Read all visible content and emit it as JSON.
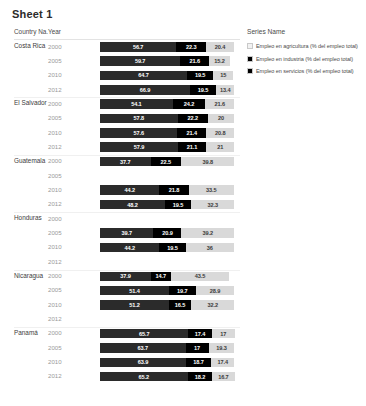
{
  "title": "Sheet 1",
  "table": {
    "headers": {
      "country": "Country Na.",
      "year": "Year"
    }
  },
  "legend": {
    "title": "Series Name",
    "items": [
      {
        "label": "Empleo en agricultura (% del empleo total)",
        "color": "#2b2b2b",
        "key": "agriculture"
      },
      {
        "label": "Empleo en industria (% del empleo total)",
        "color": "#000000",
        "key": "industry"
      },
      {
        "label": "Empleo en servicios (% del empleo total)",
        "color": "#000000",
        "key": "services"
      }
    ]
  },
  "chart_data": {
    "type": "bar",
    "title": "Sheet 1",
    "xlabel": "",
    "ylabel": "",
    "stacked": true,
    "orientation": "horizontal",
    "xlim": [
      0,
      100
    ],
    "grid": false,
    "legend_position": "right",
    "series_names": [
      "Empleo en agricultura (% del empleo total)",
      "Empleo en industria (% del empleo total)",
      "Empleo en servicios (% del empleo total)"
    ],
    "series_colors": [
      "#2b2b2b",
      "#000000",
      "#d9d9d9"
    ],
    "groups": [
      {
        "country": "Costa Rica",
        "rows": [
          {
            "year": "2000",
            "values": [
              56.7,
              22.3,
              20.4
            ],
            "labels": [
              "56.7",
              "22.3",
              "20.4"
            ]
          },
          {
            "year": "2005",
            "values": [
              59.7,
              21.6,
              15.2
            ],
            "labels": [
              "59.7",
              "21.6",
              "15.2"
            ]
          },
          {
            "year": "2010",
            "values": [
              64.7,
              19.5,
              15
            ],
            "labels": [
              "64.7",
              "19.5",
              "15"
            ]
          },
          {
            "year": "2012",
            "values": [
              66.9,
              19.5,
              13.4
            ],
            "labels": [
              "66.9",
              "19.5",
              "13.4"
            ]
          }
        ]
      },
      {
        "country": "El Salvador",
        "rows": [
          {
            "year": "2000",
            "values": [
              54.1,
              24.2,
              21.6
            ],
            "labels": [
              "54.1",
              "24.2",
              "21.6"
            ]
          },
          {
            "year": "2005",
            "values": [
              57.8,
              22.2,
              20
            ],
            "labels": [
              "57.8",
              "22.2",
              "20"
            ]
          },
          {
            "year": "2010",
            "values": [
              57.6,
              21.4,
              20.8
            ],
            "labels": [
              "57.6",
              "21.4",
              "20.8"
            ]
          },
          {
            "year": "2012",
            "values": [
              57.9,
              21.1,
              21
            ],
            "labels": [
              "57.9",
              "21.1",
              "21"
            ]
          }
        ]
      },
      {
        "country": "Guatemala",
        "rows": [
          {
            "year": "2000",
            "values": [
              37.7,
              22.5,
              39.8
            ],
            "labels": [
              "37.7",
              "22.5",
              "39.8"
            ]
          },
          {
            "year": "2005",
            "values": null,
            "labels": null
          },
          {
            "year": "2010",
            "values": [
              44.2,
              21.8,
              33.5
            ],
            "labels": [
              "44.2",
              "21.8",
              "33.5"
            ]
          },
          {
            "year": "2012",
            "values": [
              48.2,
              19.5,
              32.3
            ],
            "labels": [
              "48.2",
              "19.5",
              "32.3"
            ]
          }
        ]
      },
      {
        "country": "Honduras",
        "rows": [
          {
            "year": "2000",
            "values": null,
            "labels": null
          },
          {
            "year": "2005",
            "values": [
              39.7,
              20.9,
              39.2
            ],
            "labels": [
              "39.7",
              "20.9",
              "39.2"
            ]
          },
          {
            "year": "2010",
            "values": [
              44.2,
              19.5,
              36
            ],
            "labels": [
              "44.2",
              "19.5",
              "36"
            ]
          },
          {
            "year": "2012",
            "values": null,
            "labels": null
          }
        ]
      },
      {
        "country": "Nicaragua",
        "rows": [
          {
            "year": "2000",
            "values": [
              37.9,
              14.7,
              43.5
            ],
            "labels": [
              "37.9",
              "14.7",
              "43.5"
            ]
          },
          {
            "year": "2005",
            "values": [
              51.4,
              19.7,
              28.9
            ],
            "labels": [
              "51.4",
              "19.7",
              "28.9"
            ]
          },
          {
            "year": "2010",
            "values": [
              51.2,
              16.5,
              32.2
            ],
            "labels": [
              "51.2",
              "16.5",
              "32.2"
            ]
          },
          {
            "year": "2012",
            "values": null,
            "labels": null
          }
        ]
      },
      {
        "country": "Panamá",
        "rows": [
          {
            "year": "2000",
            "values": [
              65.7,
              17.4,
              17
            ],
            "labels": [
              "65.7",
              "17.4",
              "17"
            ]
          },
          {
            "year": "2005",
            "values": [
              63.7,
              17,
              19.3
            ],
            "labels": [
              "63.7",
              "17",
              "19.3"
            ]
          },
          {
            "year": "2010",
            "values": [
              63.9,
              18.7,
              17.4
            ],
            "labels": [
              "63.9",
              "18.7",
              "17.4"
            ]
          },
          {
            "year": "2012",
            "values": [
              65.2,
              18.2,
              16.7
            ],
            "labels": [
              "65.2",
              "18.2",
              "16.7"
            ]
          }
        ]
      }
    ]
  }
}
